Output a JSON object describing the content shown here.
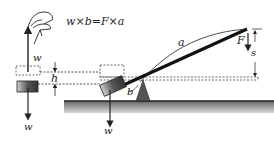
{
  "figure": {
    "equation": "w×b=F×a",
    "labels": {
      "w_up": "w",
      "h": "h",
      "w_left_down": "w",
      "w_right_down": "w",
      "a": "a",
      "b": "b",
      "F": "F",
      "s": "s"
    },
    "colors": {
      "ink": "#222222",
      "ground": "#8a8a8a",
      "block": "#5a5a5a",
      "fulcrum": "#555555",
      "dashed": "#444444"
    }
  }
}
